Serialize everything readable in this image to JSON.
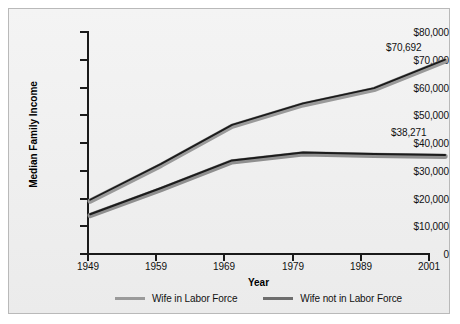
{
  "chart_data": {
    "type": "line",
    "title": "",
    "xlabel": "Year",
    "ylabel": "Median Family Income",
    "x": [
      1949,
      1959,
      1969,
      1979,
      1989,
      2001
    ],
    "categories": [
      "1949",
      "1959",
      "1969",
      "1979",
      "1989",
      "2001"
    ],
    "series": [
      {
        "name": "Wife in Labor Force",
        "color": "#9a9a9a",
        "values": [
          23000,
          35200,
          48500,
          55800,
          61000,
          70692
        ],
        "end_label": "$70,692"
      },
      {
        "name": "Wife not in Labor Force",
        "color": "#6d6d6d",
        "values": [
          18100,
          27000,
          36400,
          39100,
          38600,
          38271
        ],
        "end_label": "$38,271"
      }
    ],
    "ylim": [
      0,
      80000
    ],
    "yticks": [
      0,
      10000,
      20000,
      30000,
      40000,
      50000,
      60000,
      70000,
      80000
    ],
    "ytick_labels": [
      "0",
      "$10,000",
      "$20,000",
      "$30,000",
      "$40,000",
      "$50,000",
      "$60,000",
      "$70,000",
      "$80,000"
    ],
    "xtick_labels": [
      "1949",
      "1959",
      "1969",
      "1979",
      "1989",
      "2001"
    ],
    "grid": false,
    "legend_position": "bottom"
  },
  "axes": {
    "y_title": "Median Family Income",
    "x_title": "Year"
  },
  "legend": {
    "items": [
      {
        "label": "Wife in Labor Force",
        "color": "#9a9a9a"
      },
      {
        "label": "Wife not in Labor Force",
        "color": "#6d6d6d"
      }
    ]
  },
  "annotations": {
    "upper_end": "$70,692",
    "lower_end": "$38,271"
  },
  "colors": {
    "background": "#f1f1f1",
    "frame_border": "#b9b9b9",
    "axis": "#1a1a1a",
    "text": "#111111",
    "series_light": "#9a9a9a",
    "series_dark": "#6d6d6d",
    "line_outline": "#1b1b1b"
  }
}
